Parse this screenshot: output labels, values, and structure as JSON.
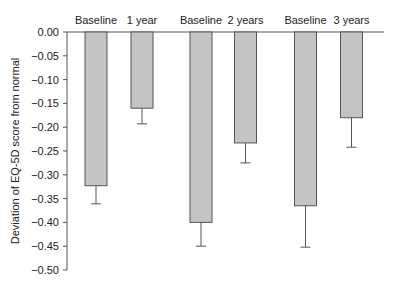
{
  "chart_data": {
    "type": "bar",
    "title": "",
    "xlabel": "",
    "ylabel": "Deviation of EQ-5D score from normal",
    "ylim": [
      -0.5,
      0.0
    ],
    "yticks": [
      0.0,
      -0.05,
      -0.1,
      -0.15,
      -0.2,
      -0.25,
      -0.3,
      -0.35,
      -0.4,
      -0.45,
      -0.5
    ],
    "ytick_labels": [
      "0.00",
      "−0.05",
      "−0.10",
      "−0.15",
      "−0.20",
      "−0.25",
      "−0.30",
      "−0.35",
      "−0.40",
      "−0.45",
      "−0.50"
    ],
    "categories": [
      "Baseline",
      "1 year",
      "Baseline",
      "2 years",
      "Baseline",
      "3 years"
    ],
    "values": [
      -0.323,
      -0.16,
      -0.4,
      -0.233,
      -0.365,
      -0.18
    ],
    "error_lower": [
      -0.361,
      -0.193,
      -0.45,
      -0.275,
      -0.452,
      -0.242
    ],
    "groups": [
      {
        "pair": [
          "Baseline",
          "1 year"
        ],
        "values": [
          -0.323,
          -0.16
        ]
      },
      {
        "pair": [
          "Baseline",
          "2 years"
        ],
        "values": [
          -0.4,
          -0.233
        ]
      },
      {
        "pair": [
          "Baseline",
          "3 years"
        ],
        "values": [
          -0.365,
          -0.18
        ]
      }
    ],
    "grid": false,
    "legend": null,
    "bar_color": "#c4c4c4",
    "edge_color": "#555555"
  }
}
